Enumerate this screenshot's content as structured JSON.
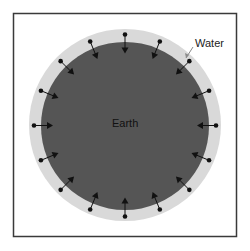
{
  "diagram": {
    "labels": {
      "earth": "Earth",
      "water": "Water"
    },
    "colors": {
      "frame": "#3a3a3a",
      "background": "#ffffff",
      "water": "#d9d9d9",
      "earth": "#555555",
      "arrow": "#111111",
      "text": "#111111",
      "leader": "#8a8a8a"
    },
    "arrow_count": 16,
    "arrow_direction": "inward"
  }
}
